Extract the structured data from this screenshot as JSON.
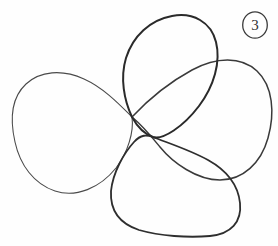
{
  "page": {
    "background_color": "#fefefe",
    "width": 278,
    "height": 246
  },
  "annotation": {
    "page_number_label": "3",
    "page_number_style": "circled",
    "ring_color": "#3a3a3a",
    "glyph_color": "#303030"
  },
  "drawing": {
    "medium": "pencil",
    "ink_color": "#2c2c2c",
    "light_ink_color": "#5a5a5a",
    "description": "Four overlapping hand-drawn loops arranged as petals crossing near the centre",
    "crossing_points": [
      {
        "name": "upper-crossing",
        "x": 132,
        "y": 117
      },
      {
        "name": "lower-crossing",
        "x": 153,
        "y": 137
      },
      {
        "name": "right-crossing",
        "x": 212,
        "y": 62
      },
      {
        "name": "lower-right-crossing",
        "x": 216,
        "y": 172
      }
    ],
    "petals": [
      {
        "name": "left-petal",
        "label": "Left loop",
        "stroke_width": 1.1,
        "ink": "#4a4a4a",
        "path": "M132,117 C120,105 104,88 84,79 C62,69 40,71 26,84 C11,98 10,120 15,142 C20,165 34,184 55,191 C76,198 100,188 116,168 C128,152 134,132 132,117 Z"
      },
      {
        "name": "top-petal",
        "label": "Top loop",
        "stroke_width": 2.0,
        "ink": "#2a2a2a",
        "path": "M132,117 C124,100 120,78 126,58 C133,36 150,20 172,16 C193,12 211,22 216,42 C221,62 214,86 199,106 C183,127 163,140 153,137 C144,134 138,128 132,117 Z"
      },
      {
        "name": "right-petal",
        "label": "Right loop",
        "stroke_width": 1.5,
        "ink": "#3a3a3a",
        "path": "M132,117 C146,102 168,83 192,70 C216,57 241,56 257,71 C273,86 275,113 268,138 C261,163 243,180 220,180 C197,180 173,163 160,147 C151,136 144,127 132,117 Z"
      },
      {
        "name": "bottom-petal",
        "label": "Bottom loop",
        "stroke_width": 1.8,
        "ink": "#2e2e2e",
        "path": "M153,137 C168,143 190,150 208,160 C226,170 238,184 240,203 C242,222 231,234 210,236 C188,238 160,236 139,230 C118,223 110,209 111,191 C113,172 124,153 134,142 C141,134 147,135 153,137 Z"
      }
    ]
  }
}
